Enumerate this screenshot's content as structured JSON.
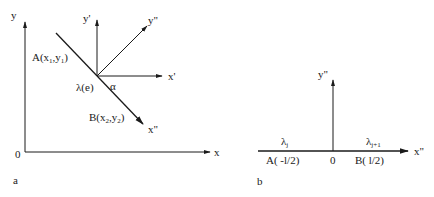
{
  "panel_a": {
    "label": "a",
    "axes": {
      "y": "y",
      "x": "x",
      "origin": "0"
    },
    "local_axes": {
      "y_prime": "y'",
      "x_prime": "x'",
      "y_dblprime": "y\"",
      "x_dblprime": "x\""
    },
    "points": {
      "A": {
        "prefix": "A(x",
        "sub1": "1",
        "mid": ",y",
        "sub2": "1",
        "suffix": ")"
      },
      "B": {
        "prefix": "B(x",
        "sub1": "2",
        "mid": ",y",
        "sub2": "2",
        "suffix": ")"
      }
    },
    "element_label": "λ(e)",
    "angle_label": "α"
  },
  "panel_b": {
    "label": "b",
    "axes": {
      "y": "y\"",
      "x": "x\"",
      "origin": "0"
    },
    "point_A": "A( -l/2)",
    "point_B": "B( l/2)",
    "lambda_j": {
      "base": "λ",
      "sub": "j"
    },
    "lambda_j1": {
      "base": "λ",
      "sub": "j+1"
    }
  }
}
